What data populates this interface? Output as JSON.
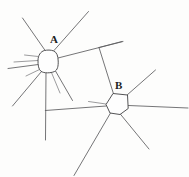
{
  "figure": {
    "kind": "hand-drawn-line-diagram",
    "width": 189,
    "height": 177,
    "background_color": "#fdfdfc",
    "ink_color": "#5c5c5e",
    "soma_outline_color": "#4a4a4c",
    "label_color": "#1d1d1f"
  },
  "labels": {
    "cell_a": "A",
    "cell_b": "B"
  },
  "cells": [
    {
      "id": "cell-a",
      "label": "A",
      "soma_center": [
        48,
        61
      ],
      "soma_path": "M 44.5 50.5 C 40.5 51.5 38.2 55.5 38.0 60.0 C 37.8 65.0 38.6 69.5 41.0 71.3 C 44.0 73.4 50.5 73.2 54.3 71.6 C 57.6 70.2 58.4 66.0 58.2 61.0 C 58.0 56.0 57.0 52.3 53.5 50.9 C 50.8 49.8 47.3 49.9 44.5 50.5 Z",
      "process_count": 11
    },
    {
      "id": "cell-b",
      "label": "B",
      "soma_center": [
        117,
        104
      ],
      "soma_path": "M 113.0 93.5 L 127.5 95.0 L 128.2 108.5 L 120.0 114.5 L 110.0 113.0 L 106.0 104.5 Z",
      "process_count": 7
    }
  ],
  "processes": {
    "cell_a": [
      {
        "name": "a-process-up-left",
        "path": "M 45.5 51.0 L 22.5 18.0"
      },
      {
        "name": "a-process-up-right",
        "path": "M 54.0 50.5 L 88.5 11.5"
      },
      {
        "name": "a-process-right-upper",
        "path": "M 58.0 58.0 L 123.0 41.5"
      },
      {
        "name": "a-process-left-short",
        "path": "M 38.2 56.5 L 24.5 55.0"
      },
      {
        "name": "a-process-left-mid",
        "path": "M 37.9 60.5 L 14.0 62.0"
      },
      {
        "name": "a-process-left-long",
        "path": "M 38.4 64.5 L 8.0 68.5"
      },
      {
        "name": "a-process-left-lower",
        "path": "M 39.5 69.5 L 26.0 76.0"
      },
      {
        "name": "a-process-down-left",
        "path": "M 41.5 71.5 L 12.5 106.0"
      },
      {
        "name": "a-process-down-center",
        "path": "M 46.0 72.8 L 45.5 140.0"
      },
      {
        "name": "a-process-down-right-short",
        "path": "M 51.5 72.6 L 60.0 93.0"
      },
      {
        "name": "a-process-down-right-long",
        "path": "M 55.5 71.0 L 72.5 100.5"
      }
    ],
    "cell_b": [
      {
        "name": "b-process-up-left-to-a-branch",
        "path": "M 113.5 93.8 L 99.0 47.5"
      },
      {
        "name": "b-branch-tip",
        "path": "M 99.0 47.5 L 122.0 41.5"
      },
      {
        "name": "b-process-up-right",
        "path": "M 126.5 95.5 L 155.5 70.0"
      },
      {
        "name": "b-process-right",
        "path": "M 128.2 105.5 L 188.0 108.0"
      },
      {
        "name": "b-process-left-horizontal",
        "path": "M 106.2 106.0 L 45.3 110.5"
      },
      {
        "name": "b-process-down-left",
        "path": "M 110.5 113.0 L 74.0 175.5"
      },
      {
        "name": "b-process-down-right",
        "path": "M 120.5 114.3 L 149.0 149.0"
      },
      {
        "name": "b-process-left-stub",
        "path": "M 106.0 104.0 L 88.5 101.5"
      }
    ]
  }
}
